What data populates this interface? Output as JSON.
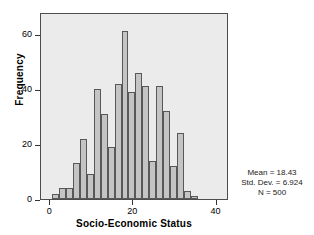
{
  "chart_data": {
    "type": "bar",
    "title": "",
    "subtitle": "",
    "xlabel": "Socio-Economic Status",
    "ylabel": "Frequency",
    "xlim": [
      -2.2,
      43.0
    ],
    "ylim": [
      0,
      68
    ],
    "grid": false,
    "legend": null,
    "x_ticks": [
      {
        "value": 0,
        "label": "0"
      },
      {
        "value": 20,
        "label": "20"
      },
      {
        "value": 40,
        "label": "40"
      }
    ],
    "y_ticks": [
      {
        "value": 0,
        "label": "0"
      },
      {
        "value": 20,
        "label": "20"
      },
      {
        "value": 40,
        "label": "40"
      },
      {
        "value": 60,
        "label": "60"
      }
    ],
    "bin_width": 1.667,
    "bin_starts": [
      0.5,
      2.17,
      3.83,
      5.5,
      7.17,
      8.83,
      10.5,
      12.17,
      13.83,
      15.5,
      17.17,
      18.83,
      20.5,
      22.17,
      23.83,
      25.5,
      27.17,
      28.83,
      30.5,
      32.17,
      33.83
    ],
    "bin_centers": [
      1.33,
      3.0,
      4.67,
      6.33,
      8.0,
      9.67,
      11.33,
      13.0,
      14.67,
      16.33,
      18.0,
      19.67,
      21.33,
      23.0,
      24.67,
      26.33,
      28.0,
      29.67,
      31.33,
      33.0,
      34.67
    ],
    "categories": [
      "1.3",
      "3.0",
      "4.7",
      "6.3",
      "8.0",
      "9.7",
      "11.3",
      "13.0",
      "14.7",
      "16.3",
      "18.0",
      "19.7",
      "21.3",
      "23.0",
      "24.7",
      "26.3",
      "28.0",
      "29.7",
      "31.3",
      "33.0",
      "34.7"
    ],
    "values": [
      2,
      4,
      4,
      13,
      22,
      9,
      40,
      31,
      19,
      42,
      61,
      39,
      46,
      41,
      14,
      41,
      32,
      12,
      24,
      3,
      1
    ],
    "bar_fill_color": "#c4c4c4",
    "bar_edge_color": "#585858",
    "plot_background_color": "#ebebeb",
    "figure_background_color": "#ffffff",
    "annotations": [
      "Mean  =  18.43",
      "Std. Dev.  =  6.924",
      "N  =  500"
    ]
  },
  "axes": {
    "y_title": "Frequency",
    "x_title": "Socio-Economic Status"
  },
  "stats": {
    "mean_line": "Mean  =  18.43",
    "stddev_line": "Std. Dev.  =  6.924",
    "n_line": "N  =  500",
    "mean_value": 18.43,
    "stddev_value": 6.924,
    "n_value": 500
  }
}
